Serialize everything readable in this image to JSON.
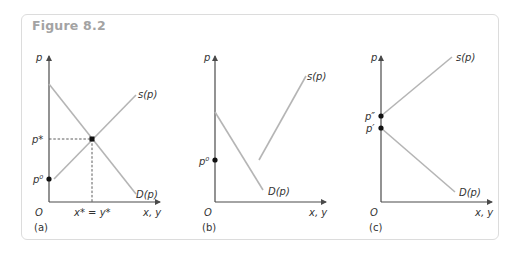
{
  "figure": {
    "title": "Figure 8.2",
    "colors": {
      "axis": "#4a4a4a",
      "curve": "#b5b5b5",
      "point": "#111111",
      "title": "#a3a3a3"
    }
  },
  "panels": [
    {
      "id": "a",
      "label": "(a)",
      "y_axis_label": "p",
      "x_axis_label": "x, y",
      "origin_label": "O",
      "supply_label": "s(p)",
      "demand_label": "D(p)",
      "points": [
        {
          "name": "p0",
          "label": "p⁰"
        },
        {
          "name": "p-star",
          "label": "p*"
        }
      ],
      "x_tick_label": "x* = y*",
      "description": "Downward-sloping demand intersects upward-sloping supply at equilibrium (x*, p*); supply starts at p0"
    },
    {
      "id": "b",
      "label": "(b)",
      "y_axis_label": "p",
      "x_axis_label": "x, y",
      "origin_label": "O",
      "supply_label": "s(p)",
      "demand_label": "D(p)",
      "points": [
        {
          "name": "p0",
          "label": "p⁰"
        }
      ],
      "description": "Supply and demand curves do not intersect; supply lies to the right of demand"
    },
    {
      "id": "c",
      "label": "(c)",
      "y_axis_label": "p",
      "x_axis_label": "x, y",
      "origin_label": "O",
      "supply_label": "s(p)",
      "demand_label": "D(p)",
      "points": [
        {
          "name": "p-double-prime",
          "label": "p″"
        },
        {
          "name": "p-prime",
          "label": "p′"
        }
      ],
      "description": "Supply starts at p'' above demand intercept p'; no positive-quantity equilibrium"
    }
  ]
}
